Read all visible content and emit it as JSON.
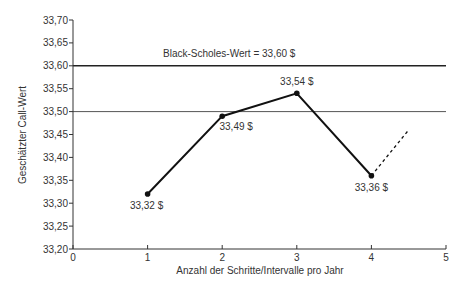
{
  "chart_data": {
    "type": "line",
    "title": "",
    "xlabel": "Anzahl der Schritte/Intervalle pro Jahr",
    "ylabel": "Geschätzter Call-Wert",
    "xlim": [
      0,
      5
    ],
    "ylim": [
      33.2,
      33.7
    ],
    "x_ticks": [
      "0",
      "1",
      "2",
      "3",
      "4",
      "5"
    ],
    "y_ticks": [
      "33,20",
      "33,25",
      "33,30",
      "33,35",
      "33,40",
      "33,45",
      "33,50",
      "33,55",
      "33,60",
      "33,65",
      "33,70"
    ],
    "grid": false,
    "series": [
      {
        "name": "Geschätzter Call-Wert",
        "x": [
          1,
          2,
          3,
          4
        ],
        "values": [
          33.32,
          33.49,
          33.54,
          33.36
        ],
        "labels": [
          "33,32 $",
          "33,49 $",
          "33,54 $",
          "33,36 $"
        ],
        "style": "solid",
        "markers": true
      },
      {
        "name": "Trend (Fortsetzung)",
        "x": [
          4,
          4.5
        ],
        "values": [
          33.36,
          33.46
        ],
        "style": "dashed"
      }
    ],
    "reference_lines": [
      {
        "y": 33.6,
        "label": "Black-Scholes-Wert = 33,60 $",
        "weight": "bold"
      },
      {
        "y": 33.5,
        "label": "",
        "weight": "thin"
      }
    ],
    "annotations": [
      "Black-Scholes-Wert = 33,60 $"
    ]
  }
}
